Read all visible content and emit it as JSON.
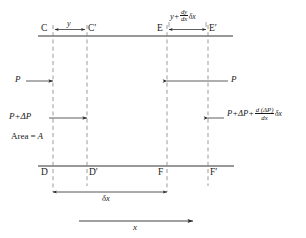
{
  "figure": {
    "type": "physics-diagram",
    "points": {
      "top_left": "C",
      "top_left_prime": "C′",
      "top_right": "E",
      "top_right_prime": "E′",
      "bottom_left": "D",
      "bottom_left_prime": "D′",
      "bottom_right": "F",
      "bottom_right_prime": "F′"
    },
    "labels": {
      "displacement_left": "y",
      "displacement_right": {
        "base": "y",
        "plus": "+",
        "frac_num": "dy",
        "frac_den": "dx",
        "tail": "δx"
      },
      "pressure_left": "P",
      "pressure_right": "P",
      "pressure_plus_left": "P+ΔP",
      "pressure_plus_right": {
        "base": "P+ΔP+",
        "frac_num": "d (ΔP)",
        "frac_den": "dx",
        "tail": "δx"
      },
      "area": "Area = A",
      "area_prefix": "Area",
      "area_equals": "=",
      "area_symbol": "A",
      "delta_x": "δx",
      "x_axis": "x"
    },
    "geometry": {
      "vertical_lines_x": [
        53,
        87,
        167,
        208
      ],
      "top_boundary_y": 36,
      "bottom_boundary_y": 166,
      "dim_line_y": 196,
      "axis_line_y": 223
    },
    "colors": {
      "line": "#1a1a1a",
      "dashed": "#7a7a7a",
      "background": "#ffffff"
    }
  }
}
